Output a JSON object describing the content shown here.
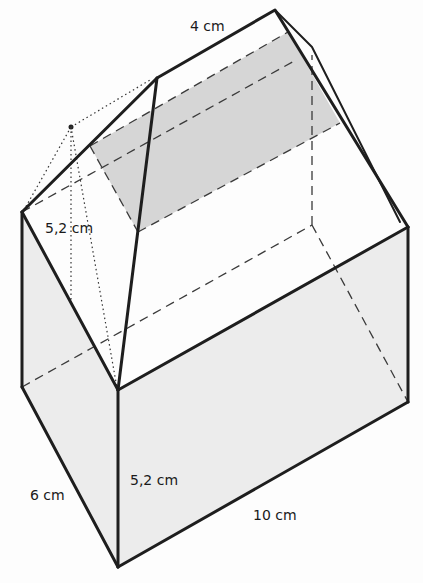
{
  "figure": {
    "type": "3d-solid-house",
    "colors": {
      "line": "#1e1e1e",
      "shaded": "#d6d6d6",
      "wall": "#ececec"
    },
    "labels": {
      "ridge": "4 cm",
      "roof_height": "5,2 cm",
      "wall_height": "5,2 cm",
      "depth": "6 cm",
      "length": "10 cm"
    }
  }
}
